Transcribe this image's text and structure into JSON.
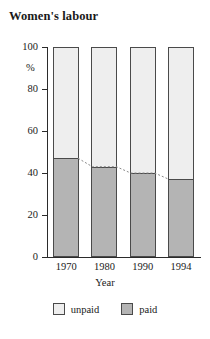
{
  "chart_data": {
    "type": "bar",
    "title": "Women's labour",
    "subtitle": "",
    "xlabel": "Year",
    "ylabel": "%",
    "categories": [
      "1970",
      "1980",
      "1990",
      "1994"
    ],
    "ylim": [
      0,
      100
    ],
    "yticks": [
      0,
      20,
      40,
      60,
      80,
      100
    ],
    "ytick_labels": [
      "0",
      "20",
      "40",
      "60",
      "80",
      "100"
    ],
    "grid": false,
    "stacked": true,
    "legend_position": "bottom",
    "series": [
      {
        "name": "paid",
        "values": [
          47,
          43,
          40,
          37
        ],
        "color": "#b4b4b4"
      },
      {
        "name": "unpaid",
        "values": [
          53,
          57,
          60,
          63
        ],
        "color": "#eeeeee"
      }
    ],
    "annotations": [
      {
        "name": "paid-trend-line",
        "style": "dotted",
        "values": [
          47,
          43,
          40,
          37
        ]
      }
    ]
  },
  "legend": {
    "items": [
      {
        "label": "unpaid",
        "swatch": "unpaid"
      },
      {
        "label": "paid",
        "swatch": "paid"
      }
    ]
  },
  "colors": {
    "paid": "#b4b4b4",
    "unpaid": "#eeeeee",
    "outline": "#4a4a4a",
    "axis": "#2b2b2b",
    "text": "#1a1a1a"
  }
}
